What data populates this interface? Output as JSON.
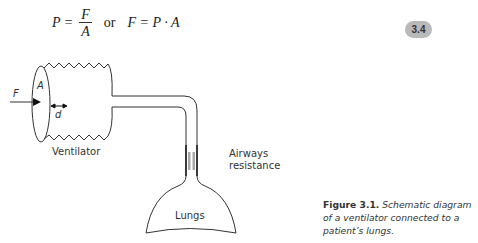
{
  "equation": {
    "lhs1": "P =",
    "frac_num": "F",
    "frac_den": "A",
    "connector": "or",
    "rhs": "F = P · A"
  },
  "equation_number": "3.4",
  "diagram": {
    "labels": {
      "force": "F",
      "area": "A",
      "displacement": "d",
      "ventilator": "Ventilator",
      "airways_line1": "Airways",
      "airways_line2": "resistance",
      "lungs": "Lungs"
    },
    "colors": {
      "stroke": "#333333",
      "resistance_bar": "#a8a8a8",
      "badge": "#b9b9b9"
    }
  },
  "caption": {
    "label": "Figure 3.1.",
    "text": "Schematic diagram of a ventilator connected to a patient’s lungs."
  }
}
